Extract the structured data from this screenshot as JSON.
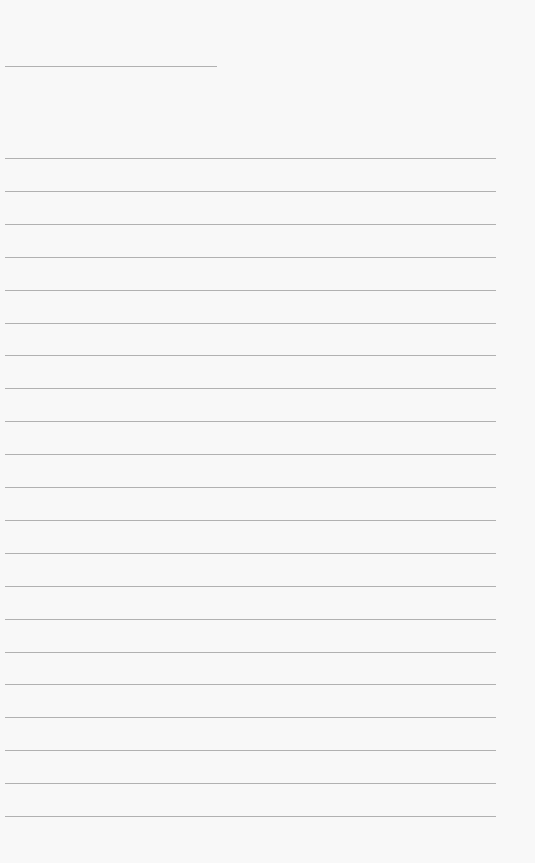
{
  "page": {
    "type": "blank lined writing paper",
    "header_line": {
      "x": 5,
      "y": 66,
      "width": 212
    },
    "ruled_lines": {
      "count": 21,
      "start_y": 158,
      "spacing": 32.9,
      "x": 5,
      "width": 491
    },
    "line_color": "#9a9a9a",
    "background_color": "#f8f8f8"
  }
}
